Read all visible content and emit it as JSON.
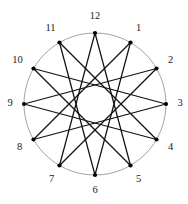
{
  "figure": {
    "width": 188,
    "height": 204,
    "background_color": "#ffffff"
  },
  "chart_data": {
    "type": "diagram",
    "subtype": "star-polygon",
    "title": "",
    "schlafli_symbol": "{12/5}",
    "vertex_count": 12,
    "step": 5,
    "geometry": {
      "center_x": 95,
      "center_y": 104,
      "outer_radius": 71,
      "label_radius": 87,
      "inner_hollow_radius": 18.4,
      "vertex_dot_radius": 2.1,
      "angle_step_degrees": 30,
      "label_start_angle_degrees": -90
    },
    "colors": {
      "circle_stroke": "#8c8c8c",
      "chord_stroke": "#111111",
      "vertex_fill": "#000000",
      "label_fill": "#1a1a1a",
      "background": "#ffffff"
    },
    "labels": [
      "12",
      "1",
      "2",
      "3",
      "4",
      "5",
      "6",
      "7",
      "8",
      "9",
      "10",
      "11"
    ],
    "vertices": [
      {
        "label": "12",
        "clock_hour": 12,
        "index": 0,
        "angle_degrees": -90,
        "x": 95,
        "y": 33,
        "label_x": 95,
        "label_y": 17
      },
      {
        "label": "1",
        "clock_hour": 1,
        "index": 1,
        "angle_degrees": -60,
        "x": 130.5,
        "y": 42.5,
        "label_x": 138.5,
        "label_y": 28.5
      },
      {
        "label": "2",
        "clock_hour": 2,
        "index": 2,
        "angle_degrees": -30,
        "x": 156.5,
        "y": 68.5,
        "label_x": 170.5,
        "label_y": 60.5
      },
      {
        "label": "3",
        "clock_hour": 3,
        "index": 3,
        "angle_degrees": 0,
        "x": 166,
        "y": 104,
        "label_x": 180,
        "label_y": 104
      },
      {
        "label": "4",
        "clock_hour": 4,
        "index": 4,
        "angle_degrees": 30,
        "x": 156.5,
        "y": 139.5,
        "label_x": 170.5,
        "label_y": 147.5
      },
      {
        "label": "5",
        "clock_hour": 5,
        "index": 5,
        "angle_degrees": 60,
        "x": 130.5,
        "y": 165.5,
        "label_x": 138.5,
        "label_y": 179.5
      },
      {
        "label": "6",
        "clock_hour": 6,
        "index": 6,
        "angle_degrees": 90,
        "x": 95,
        "y": 175,
        "label_x": 95,
        "label_y": 191
      },
      {
        "label": "7",
        "clock_hour": 7,
        "index": 7,
        "angle_degrees": 120,
        "x": 59.5,
        "y": 165.5,
        "label_x": 51.5,
        "label_y": 179.5
      },
      {
        "label": "8",
        "clock_hour": 8,
        "index": 8,
        "angle_degrees": 150,
        "x": 33.5,
        "y": 139.5,
        "label_x": 19.5,
        "label_y": 147.5
      },
      {
        "label": "9",
        "clock_hour": 9,
        "index": 9,
        "angle_degrees": 180,
        "x": 24,
        "y": 104,
        "label_x": 10,
        "label_y": 104
      },
      {
        "label": "10",
        "clock_hour": 10,
        "index": 10,
        "angle_degrees": 210,
        "x": 33.5,
        "y": 68.5,
        "label_x": 17.5,
        "label_y": 60.5
      },
      {
        "label": "11",
        "clock_hour": 11,
        "index": 11,
        "angle_degrees": 240,
        "x": 59.5,
        "y": 42.5,
        "label_x": 50.5,
        "label_y": 28.5
      }
    ],
    "edges": [
      {
        "from": "12",
        "to": "5",
        "from_index": 0,
        "to_index": 5
      },
      {
        "from": "1",
        "to": "6",
        "from_index": 1,
        "to_index": 6
      },
      {
        "from": "2",
        "to": "7",
        "from_index": 2,
        "to_index": 7
      },
      {
        "from": "3",
        "to": "8",
        "from_index": 3,
        "to_index": 8
      },
      {
        "from": "4",
        "to": "9",
        "from_index": 4,
        "to_index": 9
      },
      {
        "from": "5",
        "to": "10",
        "from_index": 5,
        "to_index": 10
      },
      {
        "from": "6",
        "to": "11",
        "from_index": 6,
        "to_index": 11
      },
      {
        "from": "7",
        "to": "12",
        "from_index": 7,
        "to_index": 0
      },
      {
        "from": "8",
        "to": "1",
        "from_index": 8,
        "to_index": 1
      },
      {
        "from": "9",
        "to": "2",
        "from_index": 9,
        "to_index": 2
      },
      {
        "from": "10",
        "to": "3",
        "from_index": 10,
        "to_index": 3
      },
      {
        "from": "11",
        "to": "4",
        "from_index": 11,
        "to_index": 4
      }
    ]
  }
}
